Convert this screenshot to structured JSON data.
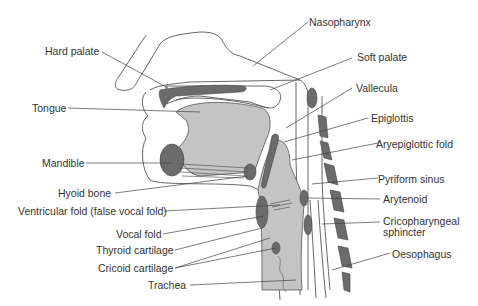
{
  "diagram": {
    "colors": {
      "background": "#ffffff",
      "outline": "#555555",
      "dark_structure": "#6b6b6b",
      "light_fill": "#c4c4c4",
      "label_text": "#333333",
      "leader_line": "#444444"
    },
    "labels_left": [
      {
        "id": "hard-palate",
        "text": "Hard palate"
      },
      {
        "id": "tongue",
        "text": "Tongue"
      },
      {
        "id": "mandible",
        "text": "Mandible"
      },
      {
        "id": "hyoid-bone",
        "text": "Hyoid bone"
      },
      {
        "id": "ventricular-fold",
        "text": "Ventricular fold (false vocal fold)"
      },
      {
        "id": "vocal-fold",
        "text": "Vocal fold"
      },
      {
        "id": "thyroid-cartilage",
        "text": "Thyroid cartilage"
      },
      {
        "id": "cricoid-cartilage",
        "text": "Cricoid cartilage"
      },
      {
        "id": "trachea",
        "text": "Trachea"
      }
    ],
    "labels_right": [
      {
        "id": "nasopharynx",
        "text": "Nasopharynx"
      },
      {
        "id": "soft-palate",
        "text": "Soft palate"
      },
      {
        "id": "vallecula",
        "text": "Vallecula"
      },
      {
        "id": "epiglottis",
        "text": "Epiglottis"
      },
      {
        "id": "aryepiglottic-fold",
        "text": "Aryepiglottic fold"
      },
      {
        "id": "pyriform-sinus",
        "text": "Pyriform sinus"
      },
      {
        "id": "arytenoid",
        "text": "Arytenoid"
      },
      {
        "id": "cricopharyngeal-sphincter-1",
        "text": "Cricopharyngeal"
      },
      {
        "id": "cricopharyngeal-sphincter-2",
        "text": "sphincter"
      },
      {
        "id": "oesophagus",
        "text": "Oesophagus"
      }
    ]
  }
}
